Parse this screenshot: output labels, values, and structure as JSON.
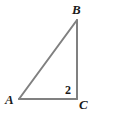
{
  "figure": {
    "name": "right-triangle-abc",
    "background_color": "#ffffff",
    "stroke_color": "#808080",
    "stroke_width": 2,
    "text_color": "#1a1a1a",
    "canvas": {
      "width": 125,
      "height": 117
    },
    "vertices": {
      "A": {
        "label": "A",
        "x": 19,
        "y": 99
      },
      "B": {
        "label": "B",
        "x": 77,
        "y": 20
      },
      "C": {
        "label": "C",
        "x": 77,
        "y": 99
      }
    },
    "sides": [
      {
        "name": "AB",
        "from": "A",
        "to": "B",
        "role": "hypotenuse"
      },
      {
        "name": "BC",
        "from": "B",
        "to": "C",
        "role": "vertical-leg"
      },
      {
        "name": "AC",
        "from": "A",
        "to": "C",
        "role": "horizontal-leg"
      }
    ],
    "annotations": [
      {
        "name": "angle-c-measure",
        "text": "2",
        "at_vertex": "C",
        "x": 68,
        "y": 90
      }
    ]
  }
}
